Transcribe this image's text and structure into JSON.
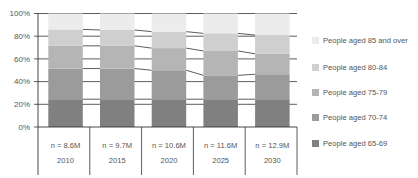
{
  "chart_data": {
    "type": "bar",
    "stacked": true,
    "normalized_percent": true,
    "title": "",
    "xlabel": "",
    "ylabel": "",
    "ylim": [
      0,
      100
    ],
    "y_ticks": [
      "0%",
      "20%",
      "40%",
      "60%",
      "80%",
      "100%"
    ],
    "grid": true,
    "series_lines": true,
    "legend_position": "right",
    "categories": [
      "2010",
      "2015",
      "2020",
      "2025",
      "2030"
    ],
    "category_sublabels": [
      "n = 8.6M",
      "n = 9.7M",
      "n = 10.6M",
      "n = 11.6M",
      "n = 12.9M"
    ],
    "series": [
      {
        "name": "People aged 65-69",
        "color": "#808080",
        "values": [
          24.5,
          24.5,
          24.5,
          24.5,
          24.5
        ]
      },
      {
        "name": "People aged 70-74",
        "color": "#9b9b9b",
        "values": [
          27.0,
          27.0,
          25.5,
          21.0,
          22.0
        ]
      },
      {
        "name": "People aged 75-79",
        "color": "#b5b5b5",
        "values": [
          20.0,
          20.0,
          19.5,
          21.5,
          18.0
        ]
      },
      {
        "name": "People aged 80-84",
        "color": "#cfcfcf",
        "values": [
          14.5,
          14.0,
          14.5,
          15.5,
          16.5
        ]
      },
      {
        "name": "People aged 85 and over",
        "color": "#ececec",
        "values": [
          14.0,
          14.5,
          16.0,
          17.5,
          19.0
        ]
      }
    ]
  },
  "legend": {
    "items": [
      {
        "label": "People aged 85 and over",
        "color": "#ececec"
      },
      {
        "label": "People aged 80-84",
        "color": "#cfcfcf"
      },
      {
        "label": "People aged 75-79",
        "color": "#b5b5b5"
      },
      {
        "label": "People aged 70-74",
        "color": "#9b9b9b"
      },
      {
        "label": "People aged 65-69",
        "color": "#808080"
      }
    ]
  },
  "colors": {
    "axis": "#333333",
    "gridline": "#333333",
    "text": "#555555"
  }
}
